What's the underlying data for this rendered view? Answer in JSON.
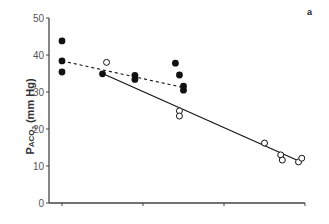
{
  "panel_label": "a",
  "chart_data": {
    "type": "scatter",
    "title": "",
    "panel": "a",
    "xlabel": "",
    "ylabel": "PACO2 (mm Hg)",
    "ylim": [
      0,
      50
    ],
    "yticks": [
      0,
      10,
      20,
      30,
      40,
      50
    ],
    "xticks_count": 4,
    "xtick_labels": [],
    "grid": false,
    "legend": null,
    "series": [
      {
        "name": "filled",
        "marker": "filled-circle",
        "fit_line": "dashed",
        "points": [
          {
            "x": 1,
            "y": 43.8
          },
          {
            "x": 1,
            "y": 38.4
          },
          {
            "x": 1,
            "y": 35.4
          },
          {
            "x": 1.5,
            "y": 34.9
          },
          {
            "x": 1.9,
            "y": 34.5
          },
          {
            "x": 1.9,
            "y": 33.4
          },
          {
            "x": 2.4,
            "y": 37.8
          },
          {
            "x": 2.45,
            "y": 34.6
          },
          {
            "x": 2.5,
            "y": 31.6
          },
          {
            "x": 2.5,
            "y": 30.5
          }
        ],
        "fit": {
          "x0": 1,
          "y0": 38.4,
          "x1": 2.5,
          "y1": 31.2
        }
      },
      {
        "name": "open",
        "marker": "open-circle",
        "fit_line": "solid",
        "points": [
          {
            "x": 1.55,
            "y": 38.0
          },
          {
            "x": 2.45,
            "y": 24.9
          },
          {
            "x": 2.45,
            "y": 23.5
          },
          {
            "x": 3.5,
            "y": 16.2
          },
          {
            "x": 3.7,
            "y": 13.0
          },
          {
            "x": 3.72,
            "y": 11.6
          },
          {
            "x": 3.92,
            "y": 11.1
          },
          {
            "x": 3.96,
            "y": 12.1
          }
        ],
        "fit": {
          "x0": 1.5,
          "y0": 35.0,
          "x1": 3.96,
          "y1": 11.0
        }
      }
    ]
  }
}
